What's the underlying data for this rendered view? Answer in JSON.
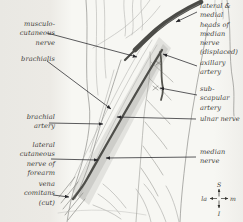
{
  "figure": {
    "type": "anatomical-diagram"
  },
  "labels": {
    "musculocutaneous_nerve": {
      "text": "musculo-\ncutaneous\nnerve"
    },
    "brachialis": {
      "text": "brachialis"
    },
    "brachial_artery": {
      "text": "brachial\nartery"
    },
    "lateral_cutaneous_nerve_of_forearm": {
      "text": "lateral\ncutaneous\nnerve of\nforearm"
    },
    "vena_comitans": {
      "text": "vena\ncomitans\n(cut)"
    },
    "median_nerve_heads": {
      "text": "lateral &\nmedial\nheads of\nmedian\nnerve\n(displaced)"
    },
    "axillary_artery": {
      "text": "axillary\nartery"
    },
    "subscapular_artery": {
      "text": "sub-\nscapular\nartery"
    },
    "ulnar_nerve": {
      "text": "ulnar nerve"
    },
    "median_nerve": {
      "text": "median\nnerve"
    }
  },
  "compass": {
    "superior": "S",
    "inferior": "I",
    "lateral": "la",
    "medial": "m"
  },
  "colors": {
    "page_bg": "#eceae5",
    "paper": "#f7f7f3",
    "label_ink": "#3e3d39",
    "leader_ink": "#26262a",
    "nerve_band_dark": "#4b4b47",
    "artery_dark": "#4e4e4a",
    "sketch_light": "#b6b6b2",
    "sketch_outline": "#9b9b97"
  }
}
